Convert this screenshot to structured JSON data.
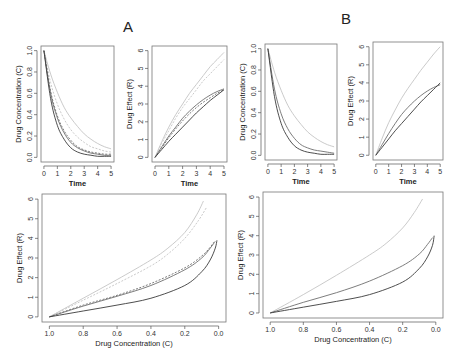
{
  "figure": {
    "labels": [
      "A",
      "B"
    ]
  },
  "colors": {
    "frame": "#777777",
    "dark": "#3a3a3a",
    "mid": "#6e6e6e",
    "light": "#c4c4c4"
  },
  "chart_data": [
    {
      "id": "A-concentration",
      "panel": "A",
      "type": "line",
      "xlabel": "Time",
      "ylabel": "Drug Concentration (C)",
      "xlim": [
        0,
        5
      ],
      "ylim": [
        0,
        1.0
      ],
      "xticks": [
        "0",
        "1",
        "2",
        "3",
        "4",
        "5"
      ],
      "yticks": [
        "0.0",
        "0.2",
        "0.4",
        "0.6",
        "0.8",
        "1.0"
      ],
      "x": [
        0,
        0.5,
        1,
        1.5,
        2,
        2.5,
        3,
        3.5,
        4,
        4.5,
        5
      ],
      "series": [
        {
          "name": "light solid",
          "color": "light",
          "style": "solid",
          "values": [
            1.0,
            0.78,
            0.61,
            0.47,
            0.37,
            0.29,
            0.22,
            0.17,
            0.13,
            0.1,
            0.08
          ]
        },
        {
          "name": "light dashed",
          "color": "light",
          "style": "dashed",
          "values": [
            1.0,
            0.7,
            0.5,
            0.36,
            0.26,
            0.19,
            0.14,
            0.1,
            0.08,
            0.06,
            0.05
          ]
        },
        {
          "name": "mid solid",
          "color": "mid",
          "style": "solid",
          "values": [
            1.0,
            0.6,
            0.37,
            0.23,
            0.14,
            0.09,
            0.06,
            0.04,
            0.03,
            0.02,
            0.02
          ]
        },
        {
          "name": "mid dashed",
          "color": "mid",
          "style": "dashed",
          "values": [
            1.0,
            0.62,
            0.39,
            0.25,
            0.16,
            0.1,
            0.07,
            0.05,
            0.04,
            0.03,
            0.03
          ]
        },
        {
          "name": "dark solid",
          "color": "dark",
          "style": "solid",
          "values": [
            1.0,
            0.55,
            0.3,
            0.17,
            0.09,
            0.05,
            0.03,
            0.02,
            0.01,
            0.01,
            0.01
          ]
        }
      ]
    },
    {
      "id": "A-effect",
      "panel": "A",
      "type": "line",
      "xlabel": "Time",
      "ylabel": "Drug Effect (R)",
      "xlim": [
        0,
        5
      ],
      "ylim": [
        0,
        6
      ],
      "xticks": [
        "0",
        "1",
        "2",
        "3",
        "4",
        "5"
      ],
      "yticks": [
        "0",
        "1",
        "2",
        "3",
        "4",
        "5",
        "6"
      ],
      "x": [
        0,
        0.5,
        1,
        1.5,
        2,
        2.5,
        3,
        3.5,
        4,
        4.5,
        5
      ],
      "series": [
        {
          "name": "light solid",
          "color": "light",
          "style": "solid",
          "values": [
            0,
            0.9,
            1.7,
            2.4,
            3.0,
            3.6,
            4.1,
            4.6,
            5.1,
            5.5,
            5.9
          ]
        },
        {
          "name": "light dashed",
          "color": "light",
          "style": "dashed",
          "values": [
            0,
            0.8,
            1.5,
            2.2,
            2.8,
            3.3,
            3.8,
            4.3,
            4.7,
            5.1,
            5.5
          ]
        },
        {
          "name": "mid solid",
          "color": "mid",
          "style": "solid",
          "values": [
            0,
            0.6,
            1.2,
            1.7,
            2.2,
            2.6,
            2.95,
            3.25,
            3.5,
            3.7,
            3.85
          ]
        },
        {
          "name": "mid dashed",
          "color": "mid",
          "style": "dashed",
          "values": [
            0,
            0.55,
            1.1,
            1.6,
            2.05,
            2.45,
            2.8,
            3.1,
            3.35,
            3.6,
            3.8
          ]
        },
        {
          "name": "dark solid",
          "color": "dark",
          "style": "solid",
          "values": [
            0,
            0.45,
            0.9,
            1.3,
            1.7,
            2.1,
            2.5,
            2.85,
            3.2,
            3.5,
            3.8
          ]
        }
      ]
    },
    {
      "id": "B-concentration",
      "panel": "B",
      "type": "line",
      "xlabel": "Time",
      "ylabel": "Drug Concentration (C)",
      "xlim": [
        0,
        5
      ],
      "ylim": [
        0,
        1.0
      ],
      "xticks": [
        "0",
        "1",
        "2",
        "3",
        "4",
        "5"
      ],
      "yticks": [
        "0.0",
        "0.2",
        "0.4",
        "0.6",
        "0.8",
        "1.0"
      ],
      "x": [
        0,
        0.5,
        1,
        1.5,
        2,
        2.5,
        3,
        3.5,
        4,
        4.5,
        5
      ],
      "series": [
        {
          "name": "light solid",
          "color": "light",
          "style": "solid",
          "values": [
            1.0,
            0.78,
            0.61,
            0.47,
            0.37,
            0.29,
            0.22,
            0.17,
            0.13,
            0.1,
            0.08
          ]
        },
        {
          "name": "mid solid",
          "color": "mid",
          "style": "solid",
          "values": [
            1.0,
            0.62,
            0.39,
            0.25,
            0.16,
            0.1,
            0.07,
            0.05,
            0.04,
            0.03,
            0.02
          ]
        },
        {
          "name": "dark solid",
          "color": "dark",
          "style": "solid",
          "values": [
            1.0,
            0.55,
            0.3,
            0.17,
            0.09,
            0.05,
            0.03,
            0.02,
            0.01,
            0.01,
            0.01
          ]
        }
      ]
    },
    {
      "id": "B-effect",
      "panel": "B",
      "type": "line",
      "xlabel": "Time",
      "ylabel": "Drug Effect (R)",
      "xlim": [
        0,
        5
      ],
      "ylim": [
        0,
        6
      ],
      "xticks": [
        "0",
        "1",
        "2",
        "3",
        "4",
        "5"
      ],
      "yticks": [
        "0",
        "1",
        "2",
        "3",
        "4",
        "5",
        "6"
      ],
      "x": [
        0,
        0.5,
        1,
        1.5,
        2,
        2.5,
        3,
        3.5,
        4,
        4.5,
        5
      ],
      "series": [
        {
          "name": "light solid",
          "color": "light",
          "style": "solid",
          "values": [
            0,
            0.95,
            1.8,
            2.5,
            3.15,
            3.7,
            4.2,
            4.7,
            5.15,
            5.6,
            6.0
          ]
        },
        {
          "name": "mid solid",
          "color": "mid",
          "style": "solid",
          "values": [
            0,
            0.6,
            1.2,
            1.75,
            2.25,
            2.65,
            3.0,
            3.3,
            3.55,
            3.75,
            3.9
          ]
        },
        {
          "name": "dark solid",
          "color": "dark",
          "style": "solid",
          "values": [
            0,
            0.45,
            0.9,
            1.35,
            1.75,
            2.15,
            2.55,
            2.95,
            3.3,
            3.65,
            4.0
          ]
        }
      ]
    },
    {
      "id": "A-phase",
      "panel": "A",
      "type": "line",
      "xlabel": "Drug Concentration (C)",
      "ylabel": "Drug Effect (R)",
      "xlim": [
        1.0,
        0.0
      ],
      "ylim": [
        0,
        6
      ],
      "xticks": [
        "1.0",
        "0.8",
        "0.6",
        "0.4",
        "0.2",
        "0.0"
      ],
      "yticks": [
        "0",
        "1",
        "2",
        "3",
        "4",
        "5",
        "6"
      ],
      "series": [
        {
          "name": "light solid",
          "color": "light",
          "style": "solid",
          "points": [
            [
              1.0,
              0
            ],
            [
              0.8,
              0.95
            ],
            [
              0.6,
              1.9
            ],
            [
              0.4,
              2.9
            ],
            [
              0.3,
              3.5
            ],
            [
              0.2,
              4.3
            ],
            [
              0.13,
              5.2
            ],
            [
              0.09,
              5.9
            ]
          ]
        },
        {
          "name": "light dashed",
          "color": "light",
          "style": "dashed",
          "points": [
            [
              1.0,
              0
            ],
            [
              0.8,
              0.85
            ],
            [
              0.6,
              1.7
            ],
            [
              0.4,
              2.6
            ],
            [
              0.3,
              3.2
            ],
            [
              0.2,
              4.0
            ],
            [
              0.12,
              4.9
            ],
            [
              0.07,
              5.6
            ]
          ]
        },
        {
          "name": "mid solid",
          "color": "mid",
          "style": "solid",
          "points": [
            [
              1.0,
              0
            ],
            [
              0.8,
              0.55
            ],
            [
              0.6,
              1.05
            ],
            [
              0.4,
              1.6
            ],
            [
              0.2,
              2.4
            ],
            [
              0.1,
              3.0
            ],
            [
              0.05,
              3.5
            ],
            [
              0.02,
              3.85
            ]
          ]
        },
        {
          "name": "mid dashed",
          "color": "mid",
          "style": "dashed",
          "points": [
            [
              1.0,
              0
            ],
            [
              0.8,
              0.6
            ],
            [
              0.6,
              1.1
            ],
            [
              0.4,
              1.7
            ],
            [
              0.2,
              2.5
            ],
            [
              0.1,
              3.1
            ],
            [
              0.05,
              3.55
            ],
            [
              0.03,
              3.8
            ]
          ]
        },
        {
          "name": "dark solid",
          "color": "dark",
          "style": "solid",
          "points": [
            [
              1.0,
              0
            ],
            [
              0.8,
              0.3
            ],
            [
              0.6,
              0.6
            ],
            [
              0.4,
              0.95
            ],
            [
              0.2,
              1.6
            ],
            [
              0.1,
              2.3
            ],
            [
              0.05,
              2.9
            ],
            [
              0.02,
              3.5
            ],
            [
              0.01,
              3.9
            ]
          ]
        }
      ]
    },
    {
      "id": "B-phase",
      "panel": "B",
      "type": "line",
      "xlabel": "Drug Concentration (C)",
      "ylabel": "Drug Effect (R)",
      "xlim": [
        1.0,
        0.0
      ],
      "ylim": [
        0,
        6
      ],
      "xticks": [
        "1.0",
        "0.8",
        "0.6",
        "0.4",
        "0.2",
        "0.0"
      ],
      "yticks": [
        "0",
        "1",
        "2",
        "3",
        "4",
        "5",
        "6"
      ],
      "series": [
        {
          "name": "light solid",
          "color": "light",
          "style": "solid",
          "points": [
            [
              1.0,
              0
            ],
            [
              0.8,
              0.95
            ],
            [
              0.6,
              1.95
            ],
            [
              0.4,
              3.0
            ],
            [
              0.3,
              3.6
            ],
            [
              0.2,
              4.4
            ],
            [
              0.13,
              5.2
            ],
            [
              0.08,
              5.9
            ]
          ]
        },
        {
          "name": "mid solid",
          "color": "mid",
          "style": "solid",
          "points": [
            [
              1.0,
              0
            ],
            [
              0.8,
              0.55
            ],
            [
              0.6,
              1.05
            ],
            [
              0.4,
              1.65
            ],
            [
              0.2,
              2.45
            ],
            [
              0.1,
              3.05
            ],
            [
              0.05,
              3.55
            ],
            [
              0.02,
              3.9
            ]
          ]
        },
        {
          "name": "dark solid",
          "color": "dark",
          "style": "solid",
          "points": [
            [
              1.0,
              0
            ],
            [
              0.8,
              0.3
            ],
            [
              0.6,
              0.6
            ],
            [
              0.4,
              0.95
            ],
            [
              0.2,
              1.6
            ],
            [
              0.1,
              2.3
            ],
            [
              0.05,
              2.9
            ],
            [
              0.02,
              3.5
            ],
            [
              0.01,
              4.0
            ]
          ]
        }
      ]
    }
  ]
}
